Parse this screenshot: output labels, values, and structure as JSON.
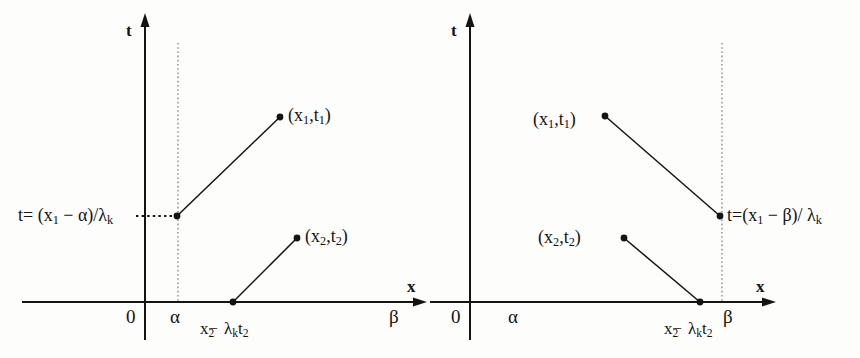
{
  "figure": {
    "type": "diagram",
    "ink_color": "#141414",
    "dotted_color": "#9a9a9a",
    "background": "#fdfdfc"
  },
  "panels": [
    {
      "id": "left",
      "axes": {
        "t_axis_label": "t",
        "x_axis_label": "x",
        "origin_label": "0"
      },
      "ticks": {
        "alpha": "α",
        "beta": "β"
      },
      "boundary_line": {
        "at": "α",
        "style": "dotted-vertical"
      },
      "equation_label": {
        "prefix": "t= (x",
        "sub1": "1",
        "middle": " − α)/λ",
        "sub2": "k",
        "full": "t= (x₁ − α)/λₖ"
      },
      "points": [
        {
          "name": "point-x1-t1",
          "label_open": "(x",
          "label_sub1": "1",
          "label_mid": ",t",
          "label_sub2": "1",
          "label_close": ")",
          "full": "(x₁,t₁)"
        },
        {
          "name": "point-x2-t2",
          "label_open": "(x",
          "label_sub1": "2",
          "label_mid": ",t",
          "label_sub2": "2",
          "label_close": ")",
          "full": "(x₂,t₂)"
        }
      ],
      "x_expression": {
        "base": "x",
        "sub": "2",
        "minus": "−",
        "lambda": "λ",
        "lambda_sub": "k",
        "t": "t",
        "t_sub": "2",
        "full": "x₂ − λₖ t₂"
      }
    },
    {
      "id": "right",
      "axes": {
        "t_axis_label": "t",
        "x_axis_label": "x",
        "origin_label": "0"
      },
      "ticks": {
        "alpha": "α",
        "beta": "β"
      },
      "boundary_line": {
        "at": "β",
        "style": "dotted-vertical"
      },
      "equation_label": {
        "prefix": "t=(x",
        "sub1": "1",
        "middle": " − β)/ λ",
        "sub2": "k",
        "full": "t=(x₁ − β)/ λₖ"
      },
      "points": [
        {
          "name": "point-x1-t1",
          "label_open": "(x",
          "label_sub1": "1",
          "label_mid": ",t",
          "label_sub2": "1",
          "label_close": ")",
          "full": "(x₁,t₁)"
        },
        {
          "name": "point-x2-t2",
          "label_open": "(x",
          "label_sub1": "2",
          "label_mid": ",t",
          "label_sub2": "2",
          "label_close": ")",
          "full": "(x₂,t₂)"
        }
      ],
      "x_expression": {
        "base": "x",
        "sub": "2",
        "minus": "−",
        "lambda": "λ",
        "lambda_sub": "k",
        "t": "t",
        "t_sub": "2",
        "full": "x₂ − λₖ t₂"
      }
    }
  ]
}
